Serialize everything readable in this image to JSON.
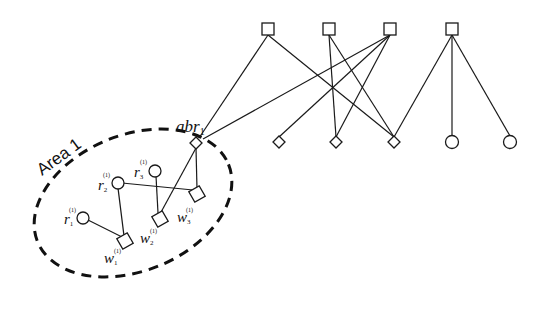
{
  "diagram": {
    "area_label": "Area 1",
    "border_router": {
      "label": "abr",
      "subscript": "1"
    },
    "nodes_area": [
      {
        "id": "r1",
        "label": "r",
        "sub": "1",
        "sup": "(1)",
        "shape": "circle"
      },
      {
        "id": "r2",
        "label": "r",
        "sub": "2",
        "sup": "(1)",
        "shape": "circle"
      },
      {
        "id": "r3",
        "label": "r",
        "sub": "3",
        "sup": "(1)",
        "shape": "circle"
      },
      {
        "id": "w1",
        "label": "w",
        "sub": "1",
        "sup": "(1)",
        "shape": "square"
      },
      {
        "id": "w2",
        "label": "w",
        "sub": "2",
        "sup": "(1)",
        "shape": "square"
      },
      {
        "id": "w3",
        "label": "w",
        "sub": "3",
        "sup": "(1)",
        "shape": "square"
      }
    ],
    "top_nodes": [
      "square-1",
      "square-2",
      "square-3",
      "square-4"
    ],
    "bottom_nodes": [
      "diamond-1",
      "diamond-2",
      "diamond-3",
      "circle-1",
      "circle-2"
    ],
    "colors": {
      "stroke": "#1a1a1a",
      "background": "#ffffff"
    }
  }
}
